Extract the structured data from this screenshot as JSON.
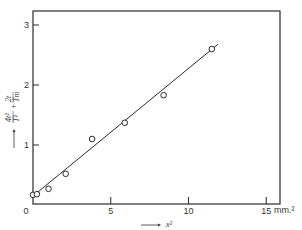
{
  "chart_data": {
    "type": "scatter",
    "title": "",
    "xlabel": "x²",
    "xunit": "mm.²",
    "ylabel": "4t²/T² + 2t/Tm",
    "xlim": [
      0,
      16
    ],
    "ylim": [
      0,
      3.2
    ],
    "xticks": [
      0,
      5,
      10,
      15
    ],
    "yticks": [
      1,
      2,
      3
    ],
    "x_tick_labels": [
      "0",
      "5",
      "10",
      "15"
    ],
    "y_tick_labels": [
      "1",
      "2",
      "3"
    ],
    "grid": false,
    "legend": null,
    "series": [
      {
        "name": "measured",
        "marker": "open-circle",
        "x": [
          0.0,
          0.25,
          1.0,
          2.1,
          3.8,
          5.9,
          8.4,
          11.5
        ],
        "y": [
          0.17,
          0.18,
          0.27,
          0.52,
          1.1,
          1.37,
          1.83,
          2.6
        ]
      },
      {
        "name": "linear fit",
        "style": "line",
        "x": [
          0.0,
          11.9
        ],
        "y": [
          0.15,
          2.68
        ]
      }
    ]
  },
  "labels": {
    "origin": "0",
    "x_unit": "mm.²",
    "x_axis": "x²",
    "y_axis_num1": "4t²",
    "y_axis_den1": "T²",
    "y_axis_plus": "+",
    "y_axis_num2": "2t",
    "y_axis_den2": "Tm",
    "arrow": "⟶"
  }
}
